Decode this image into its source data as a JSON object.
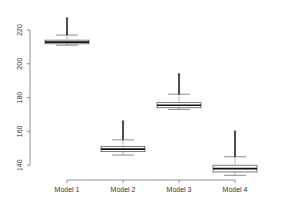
{
  "chart_data": {
    "type": "boxplot",
    "title": "",
    "xlabel": "",
    "ylabel": "",
    "ylim": [
      131,
      230
    ],
    "yticks": [
      140,
      160,
      180,
      200,
      220
    ],
    "categories": [
      "Model 1",
      "Model 2",
      "Model 3",
      "Model 4"
    ],
    "series": [
      {
        "name": "Model 1",
        "lower_whisker": 211,
        "q1": 211.8,
        "median": 212.8,
        "q3": 214,
        "upper_whisker": 217,
        "outlier_max": 227
      },
      {
        "name": "Model 2",
        "lower_whisker": 146,
        "q1": 148,
        "median": 149.5,
        "q3": 151,
        "upper_whisker": 155,
        "outlier_max": 166
      },
      {
        "name": "Model 3",
        "lower_whisker": 173,
        "q1": 174,
        "median": 175.5,
        "q3": 177,
        "upper_whisker": 182,
        "outlier_max": 194
      },
      {
        "name": "Model 4",
        "lower_whisker": 134,
        "q1": 136,
        "median": 138,
        "q3": 140,
        "upper_whisker": 145,
        "outlier_max": 160
      }
    ],
    "grid": false
  }
}
